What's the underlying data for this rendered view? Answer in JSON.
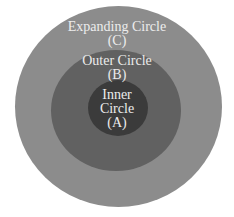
{
  "diagram": {
    "type": "concentric-circles",
    "colors": {
      "background": "#ffffff",
      "expanding": "#8c8c8c",
      "outer": "#616161",
      "inner": "#3b3b3b",
      "text": "#ececec"
    },
    "circles": [
      {
        "id": "C",
        "name": "Expanding Circle",
        "letter": "(C)"
      },
      {
        "id": "B",
        "name": "Outer Circle",
        "letter": "(B)"
      },
      {
        "id": "A",
        "name_line1": "Inner",
        "name_line2": "Circle",
        "letter": "(A)"
      }
    ]
  }
}
